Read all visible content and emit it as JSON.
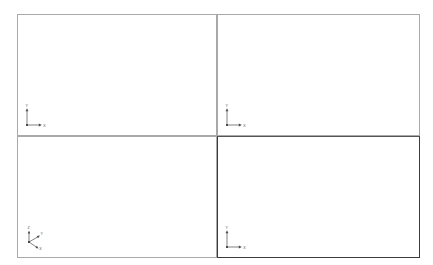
{
  "app": {
    "background_color": "#ffffff",
    "frame_color": "#a9a9a9",
    "active_frame_color": "#3c3c3c",
    "triad_color": "#4a4a4a"
  },
  "viewports": [
    {
      "id": "top-left",
      "name": "viewport-top-left",
      "active": false,
      "triad_type": "2d",
      "axes": [
        {
          "name": "y-axis",
          "label": "Y",
          "direction": "up"
        },
        {
          "name": "x-axis",
          "label": "X",
          "direction": "right"
        }
      ]
    },
    {
      "id": "top-right",
      "name": "viewport-top-right",
      "active": false,
      "triad_type": "2d",
      "axes": [
        {
          "name": "y-axis",
          "label": "Y",
          "direction": "up"
        },
        {
          "name": "x-axis",
          "label": "X",
          "direction": "right"
        }
      ]
    },
    {
      "id": "bottom-left",
      "name": "viewport-bottom-left",
      "active": false,
      "triad_type": "3d",
      "axes": [
        {
          "name": "z-axis",
          "label": "Z",
          "direction": "up"
        },
        {
          "name": "y-axis",
          "label": "Y",
          "direction": "upper-right"
        },
        {
          "name": "x-axis",
          "label": "X",
          "direction": "lower-right"
        }
      ]
    },
    {
      "id": "bottom-right",
      "name": "viewport-bottom-right",
      "active": true,
      "triad_type": "2d",
      "axes": [
        {
          "name": "y-axis",
          "label": "Y",
          "direction": "up"
        },
        {
          "name": "x-axis",
          "label": "X",
          "direction": "right"
        }
      ]
    }
  ]
}
